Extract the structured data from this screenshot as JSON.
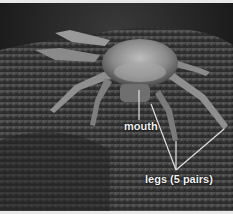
{
  "image": {
    "subject": "crab on rocky soil",
    "style": "grayscale photograph"
  },
  "annotations": {
    "mouth": "mouth",
    "legs": "legs (5 pairs)"
  }
}
